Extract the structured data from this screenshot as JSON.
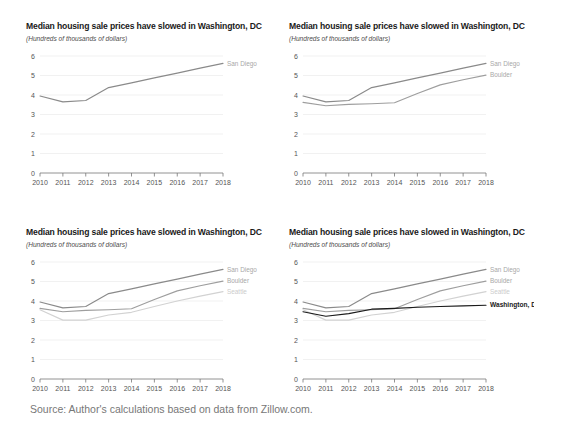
{
  "figure": {
    "source": "Source: Author's calculations based on data from Zillow.com.",
    "panels": [
      {
        "id": "panel-1",
        "title": "Median housing sale prices have slowed in Washington, DC",
        "subtitle": "(Hundreds of thousands of dollars)"
      },
      {
        "id": "panel-2",
        "title": "Median housing sale prices have slowed in Washington, DC",
        "subtitle": "(Hundreds of thousands of dollars)"
      },
      {
        "id": "panel-3",
        "title": "Median housing sale prices have slowed in Washington, DC",
        "subtitle": "(Hundreds of thousands of dollars)"
      },
      {
        "id": "panel-4",
        "title": "Median housing sale prices have slowed in Washington, DC",
        "subtitle": "(Hundreds of thousands of dollars)"
      }
    ]
  },
  "colors": {
    "san_diego": "#8a8a8a",
    "boulder": "#9e9e9e",
    "seattle": "#d2d2d2",
    "washington_dc": "#1a1a1a",
    "gridline": "#eeeeee",
    "axis": "#777777",
    "label_gray": "#a8a8a8",
    "label_light": "#cccccc",
    "label_black": "#1a1a1a",
    "source_text": "#777777"
  },
  "chart_data": [
    {
      "type": "line",
      "title": "Median housing sale prices have slowed in Washington, DC",
      "subtitle": "(Hundreds of thousands of dollars)",
      "xlabel": "",
      "ylabel": "Hundreds of thousands of dollars",
      "x": [
        2010,
        2011,
        2012,
        2013,
        2014,
        2015,
        2016,
        2017,
        2018
      ],
      "xticklabels": [
        "2010",
        "2011",
        "2012",
        "2013",
        "2014",
        "2015",
        "2016",
        "2017",
        "2018"
      ],
      "yticklabels": [
        "0",
        "1",
        "2",
        "3",
        "4",
        "5",
        "6"
      ],
      "ylim": [
        0,
        6
      ],
      "xlim": [
        2010,
        2018
      ],
      "grid": true,
      "legend_position": "line-end-labels",
      "series": [
        {
          "name": "San Diego",
          "label": "San Diego",
          "color": "#8a8a8a",
          "values": [
            3.95,
            3.65,
            3.72,
            4.38,
            4.62,
            4.88,
            5.12,
            5.38,
            5.62
          ]
        }
      ]
    },
    {
      "type": "line",
      "title": "Median housing sale prices have slowed in Washington, DC",
      "subtitle": "(Hundreds of thousands of dollars)",
      "xlabel": "",
      "ylabel": "Hundreds of thousands of dollars",
      "x": [
        2010,
        2011,
        2012,
        2013,
        2014,
        2015,
        2016,
        2017,
        2018
      ],
      "xticklabels": [
        "2010",
        "2011",
        "2012",
        "2013",
        "2014",
        "2015",
        "2016",
        "2017",
        "2018"
      ],
      "yticklabels": [
        "0",
        "1",
        "2",
        "3",
        "4",
        "5",
        "6"
      ],
      "ylim": [
        0,
        6
      ],
      "xlim": [
        2010,
        2018
      ],
      "grid": true,
      "legend_position": "line-end-labels",
      "series": [
        {
          "name": "San Diego",
          "label": "San Diego",
          "color": "#8a8a8a",
          "values": [
            3.95,
            3.65,
            3.72,
            4.38,
            4.62,
            4.88,
            5.12,
            5.38,
            5.62
          ]
        },
        {
          "name": "Boulder",
          "label": "Boulder",
          "color": "#9e9e9e",
          "values": [
            3.62,
            3.45,
            3.52,
            3.55,
            3.6,
            4.08,
            4.52,
            4.78,
            5.02
          ]
        }
      ]
    },
    {
      "type": "line",
      "title": "Median housing sale prices have slowed in Washington, DC",
      "subtitle": "(Hundreds of thousands of dollars)",
      "xlabel": "",
      "ylabel": "Hundreds of thousands of dollars",
      "x": [
        2010,
        2011,
        2012,
        2013,
        2014,
        2015,
        2016,
        2017,
        2018
      ],
      "xticklabels": [
        "2010",
        "2011",
        "2012",
        "2013",
        "2014",
        "2015",
        "2016",
        "2017",
        "2018"
      ],
      "yticklabels": [
        "0",
        "1",
        "2",
        "3",
        "4",
        "5",
        "6"
      ],
      "ylim": [
        0,
        6
      ],
      "xlim": [
        2010,
        2018
      ],
      "grid": true,
      "legend_position": "line-end-labels",
      "series": [
        {
          "name": "San Diego",
          "label": "San Diego",
          "color": "#8a8a8a",
          "values": [
            3.95,
            3.65,
            3.72,
            4.38,
            4.62,
            4.88,
            5.12,
            5.38,
            5.62
          ]
        },
        {
          "name": "Boulder",
          "label": "Boulder",
          "color": "#9e9e9e",
          "values": [
            3.62,
            3.45,
            3.52,
            3.55,
            3.6,
            4.08,
            4.52,
            4.78,
            5.02
          ]
        },
        {
          "name": "Seattle",
          "label": "Seattle",
          "color": "#d2d2d2",
          "values": [
            3.55,
            3.02,
            3.02,
            3.28,
            3.42,
            3.72,
            4.0,
            4.25,
            4.48
          ]
        }
      ]
    },
    {
      "type": "line",
      "title": "Median housing sale prices have slowed in Washington, DC",
      "subtitle": "(Hundreds of thousands of dollars)",
      "xlabel": "",
      "ylabel": "Hundreds of thousands of dollars",
      "x": [
        2010,
        2011,
        2012,
        2013,
        2014,
        2015,
        2016,
        2017,
        2018
      ],
      "xticklabels": [
        "2010",
        "2011",
        "2012",
        "2013",
        "2014",
        "2015",
        "2016",
        "2017",
        "2018"
      ],
      "yticklabels": [
        "0",
        "1",
        "2",
        "3",
        "4",
        "5",
        "6"
      ],
      "ylim": [
        0,
        6
      ],
      "xlim": [
        2010,
        2018
      ],
      "grid": true,
      "legend_position": "line-end-labels",
      "series": [
        {
          "name": "San Diego",
          "label": "San Diego",
          "color": "#8a8a8a",
          "values": [
            3.95,
            3.65,
            3.72,
            4.38,
            4.62,
            4.88,
            5.12,
            5.38,
            5.62
          ]
        },
        {
          "name": "Boulder",
          "label": "Boulder",
          "color": "#9e9e9e",
          "values": [
            3.62,
            3.45,
            3.52,
            3.55,
            3.6,
            4.08,
            4.52,
            4.78,
            5.02
          ]
        },
        {
          "name": "Seattle",
          "label": "Seattle",
          "color": "#d2d2d2",
          "values": [
            3.55,
            3.02,
            3.02,
            3.28,
            3.42,
            3.72,
            4.0,
            4.25,
            4.48
          ]
        },
        {
          "name": "Washington, DC",
          "label": "Washington, DC",
          "color": "#1a1a1a",
          "values": [
            3.45,
            3.22,
            3.35,
            3.58,
            3.62,
            3.68,
            3.72,
            3.75,
            3.78
          ]
        }
      ]
    }
  ]
}
